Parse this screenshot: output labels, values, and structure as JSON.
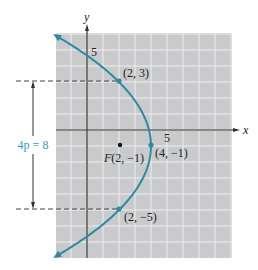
{
  "figure": {
    "axes": {
      "x_label": "x",
      "y_label": "y",
      "x_tick_label": "5",
      "y_tick_label": "5"
    },
    "points": [
      {
        "label": "(2, 3)",
        "x": 2,
        "y": 3
      },
      {
        "label": "(4, −1)",
        "x": 4,
        "y": -1
      },
      {
        "label": "(2, −5)",
        "x": 2,
        "y": -5
      }
    ],
    "focus": {
      "label": "F(2, −1)",
      "x": 2,
      "y": -1
    },
    "dimension_label": "4p = 8",
    "curve": {
      "equation": "(y+1)^2 = -8(x-4)",
      "color": "#2e8aa0"
    },
    "colors": {
      "grid_bg": "#c9cacc",
      "grid_line": "#ffffff",
      "axis": "#333333",
      "accent": "#3a9bb5"
    }
  }
}
